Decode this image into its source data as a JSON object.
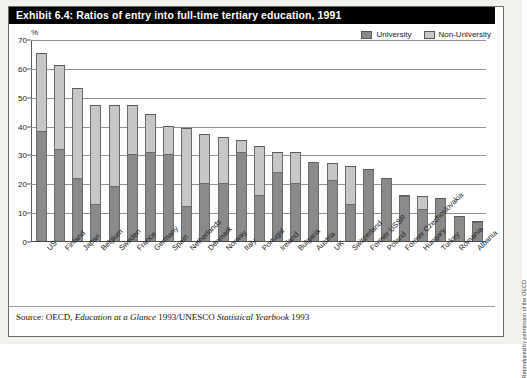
{
  "exhibit": {
    "title": "Exhibit 6.4: Ratios of entry into full-time tertiary education, 1991",
    "source_prefix": "Source: OECD, ",
    "source_italic1": "Education at a Glance",
    "source_mid": " 1993/UNESCO ",
    "source_italic2": "Statistical Yearbook",
    "source_suffix": " 1993",
    "credit": "Reproduced by permission of the OECD"
  },
  "legend": {
    "university_label": "University",
    "nonuniversity_label": "Non-University",
    "university_color": "#8a8a8a",
    "nonuniversity_color": "#c7c7c7"
  },
  "chart_data": {
    "type": "bar",
    "stacked": true,
    "title": "Exhibit 6.4: Ratios of entry into full-time tertiary education, 1991",
    "xlabel": "",
    "ylabel": "%",
    "ylim": [
      0,
      70
    ],
    "yticks": [
      0,
      10,
      20,
      30,
      40,
      50,
      60,
      70
    ],
    "grid": true,
    "legend_position": "top-right",
    "categories": [
      "US",
      "Finland",
      "Japan",
      "Belgium",
      "Sweden",
      "France",
      "Germany",
      "Spain",
      "Netherlands",
      "Denmark",
      "Norway",
      "Italy",
      "Portugal",
      "Ireland",
      "Bulgaria",
      "Austria",
      "UK",
      "Switzerland",
      "Former USSR",
      "Poland",
      "Former Czechoslovakia",
      "Hungary",
      "Turkey",
      "Romania",
      "Albania"
    ],
    "series": [
      {
        "name": "University",
        "color": "#8a8a8a",
        "values": [
          38,
          32,
          22,
          13,
          19,
          30,
          31,
          30,
          12,
          20,
          20,
          31,
          16,
          24,
          20,
          27.5,
          21,
          13,
          25,
          22,
          15.5,
          11,
          15,
          8.5,
          6.5
        ]
      },
      {
        "name": "Non-University",
        "color": "#c7c7c7",
        "values": [
          27,
          29,
          31,
          34,
          28,
          17,
          13,
          10,
          27,
          17,
          16,
          4,
          17,
          7,
          11,
          0,
          6,
          13,
          0,
          0,
          0.5,
          4.5,
          0,
          0,
          0.5
        ]
      }
    ],
    "totals": [
      65,
      61,
      53,
      47,
      47,
      47,
      44,
      40,
      39,
      37,
      36,
      35,
      33,
      31,
      31,
      27.5,
      27,
      26,
      25,
      22,
      16,
      15.5,
      15,
      8.5,
      7
    ]
  }
}
